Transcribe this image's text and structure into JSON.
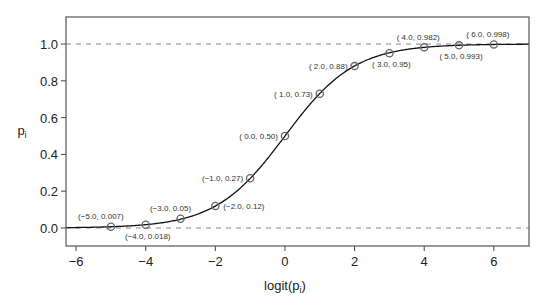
{
  "chart_data": {
    "type": "line",
    "title": "",
    "xlabel": "logit(p",
    "xlabel_sub": "i",
    "xlabel_close": ")",
    "ylabel": "p",
    "ylabel_sub": "i",
    "xlim": [
      -6.29,
      7.01
    ],
    "ylim": [
      -0.098,
      1.147
    ],
    "x_ticks": [
      -6,
      -4,
      -2,
      0,
      2,
      4,
      6
    ],
    "x_tick_labels": [
      "−6",
      "−4",
      "−2",
      "0",
      "2",
      "4",
      "6"
    ],
    "y_ticks": [
      0.0,
      0.2,
      0.4,
      0.6,
      0.8,
      1.0
    ],
    "y_tick_labels": [
      "0.0",
      "0.2",
      "0.4",
      "0.6",
      "0.8",
      "1.0"
    ],
    "reference_lines": [
      0.0,
      1.0
    ],
    "grid": false,
    "legend": null,
    "curve": "logistic p = 1 / (1 + exp(-x))",
    "series": [
      {
        "name": "logistic curve points",
        "x": [
          -5,
          -4,
          -3,
          -2,
          -1,
          0,
          1,
          2,
          3,
          4,
          5,
          6
        ],
        "y": [
          0.007,
          0.018,
          0.05,
          0.12,
          0.27,
          0.5,
          0.73,
          0.88,
          0.95,
          0.982,
          0.993,
          0.998
        ]
      }
    ],
    "annotations": [
      {
        "text": "(−5.0, 0.007)",
        "x": -5,
        "y": 0.007,
        "pos": "above-left"
      },
      {
        "text": "(−4.0, 0.018)",
        "x": -4,
        "y": 0.018,
        "pos": "below"
      },
      {
        "text": "(−3.0, 0.05)",
        "x": -3,
        "y": 0.05,
        "pos": "above-left"
      },
      {
        "text": "(−2.0, 0.12)",
        "x": -2,
        "y": 0.12,
        "pos": "right"
      },
      {
        "text": "(−1.0, 0.27)",
        "x": -1,
        "y": 0.27,
        "pos": "left"
      },
      {
        "text": "( 0.0, 0.50)",
        "x": 0,
        "y": 0.5,
        "pos": "left"
      },
      {
        "text": "( 1.0, 0.73)",
        "x": 1,
        "y": 0.73,
        "pos": "left"
      },
      {
        "text": "( 2.0, 0.88)",
        "x": 2,
        "y": 0.88,
        "pos": "left"
      },
      {
        "text": "( 3.0, 0.95)",
        "x": 3,
        "y": 0.95,
        "pos": "below"
      },
      {
        "text": "( 4.0, 0.982)",
        "x": 4,
        "y": 0.982,
        "pos": "above"
      },
      {
        "text": "( 5.0, 0.993)",
        "x": 5,
        "y": 0.993,
        "pos": "below"
      },
      {
        "text": "( 6.0, 0.998)",
        "x": 6,
        "y": 0.998,
        "pos": "above"
      }
    ]
  }
}
